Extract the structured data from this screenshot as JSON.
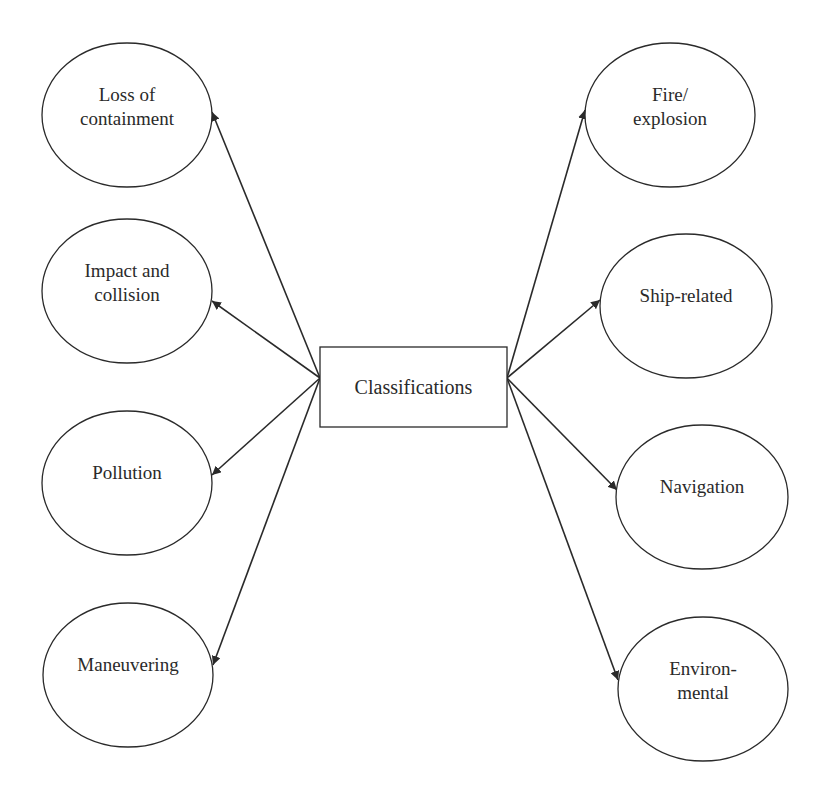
{
  "diagram": {
    "center": {
      "label": "Classifications",
      "x": 320,
      "y": 347,
      "width": 187,
      "height": 80,
      "left_anchor": [
        320,
        378
      ],
      "right_anchor": [
        507,
        378
      ]
    },
    "left_nodes": [
      {
        "id": "loss-of-containment",
        "lines": [
          "Loss of",
          "containment"
        ],
        "cx": 127,
        "cy": 115,
        "rx": 85,
        "ry": 72,
        "arrow_tip": [
          212,
          112
        ]
      },
      {
        "id": "impact-and-collision",
        "lines": [
          "Impact and",
          "collision"
        ],
        "cx": 127,
        "cy": 291,
        "rx": 85,
        "ry": 72,
        "arrow_tip": [
          212,
          301
        ]
      },
      {
        "id": "pollution",
        "lines": [
          "Pollution"
        ],
        "cx": 127,
        "cy": 483,
        "rx": 85,
        "ry": 72,
        "arrow_tip": [
          212,
          475
        ]
      },
      {
        "id": "maneuvering",
        "lines": [
          "Maneuvering"
        ],
        "cx": 128,
        "cy": 675,
        "rx": 85,
        "ry": 72,
        "arrow_tip": [
          213,
          665
        ]
      }
    ],
    "right_nodes": [
      {
        "id": "fire-explosion",
        "lines": [
          "Fire/",
          "explosion"
        ],
        "cx": 670,
        "cy": 115,
        "rx": 85,
        "ry": 72,
        "arrow_tip": [
          585,
          110
        ]
      },
      {
        "id": "ship-related",
        "lines": [
          "Ship-related"
        ],
        "cx": 686,
        "cy": 306,
        "rx": 86,
        "ry": 72,
        "arrow_tip": [
          600,
          300
        ]
      },
      {
        "id": "navigation",
        "lines": [
          "Navigation"
        ],
        "cx": 702,
        "cy": 497,
        "rx": 86,
        "ry": 72,
        "arrow_tip": [
          617,
          490
        ]
      },
      {
        "id": "environmental",
        "lines": [
          "Environ-",
          "mental"
        ],
        "cx": 703,
        "cy": 689,
        "rx": 85,
        "ry": 72,
        "arrow_tip": [
          618,
          680
        ]
      }
    ],
    "colors": {
      "stroke": "#2a2a2a",
      "text": "#2a2a2a",
      "background": "#ffffff"
    }
  }
}
